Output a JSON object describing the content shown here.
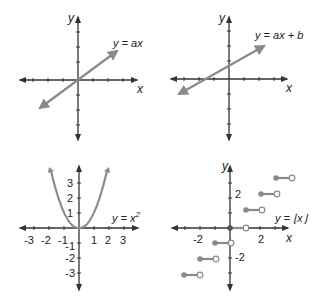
{
  "panels": [
    {
      "id": "linear",
      "equation": "y = ax",
      "x_axis_label": "x",
      "y_axis_label": "y"
    },
    {
      "id": "affine",
      "equation": "y = ax + b",
      "x_axis_label": "x",
      "y_axis_label": "y"
    },
    {
      "id": "quadratic",
      "equation_base": "y = x",
      "equation_sup": "2",
      "x_axis_label": "",
      "y_axis_label": "",
      "x_ticks": [
        "-3",
        "-2",
        "-1",
        "1",
        "2",
        "3"
      ],
      "y_ticks": [
        "3",
        "2",
        "1",
        "-1",
        "-2",
        "-3"
      ]
    },
    {
      "id": "floor",
      "equation": "y = ⌊x⌋",
      "x_axis_label": "x",
      "y_axis_label": "y",
      "x_ticks": [
        "-2",
        "2"
      ],
      "y_ticks": [
        "2",
        "-2"
      ]
    }
  ],
  "colors": {
    "axis": "#333333",
    "curve": "#8a8a8a",
    "open_dot_fill": "#ffffff"
  }
}
